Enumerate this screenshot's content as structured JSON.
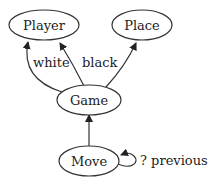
{
  "nodes": {
    "player": {
      "label": "Player"
    },
    "place": {
      "label": "Place"
    },
    "game": {
      "label": "Game"
    },
    "move": {
      "label": "Move"
    }
  },
  "edges": {
    "game_player_white": {
      "from": "Game",
      "to": "Player",
      "label": "white"
    },
    "game_player_black": {
      "from": "Game",
      "to": "Player",
      "label": "black"
    },
    "game_place": {
      "from": "Game",
      "to": "Place",
      "label": ""
    },
    "move_game": {
      "from": "Move",
      "to": "Game",
      "label": ""
    },
    "move_move": {
      "from": "Move",
      "to": "Move",
      "label": "? previous"
    }
  },
  "colors": {
    "stroke": "#333333",
    "text": "#222222",
    "background": "#ffffff"
  }
}
